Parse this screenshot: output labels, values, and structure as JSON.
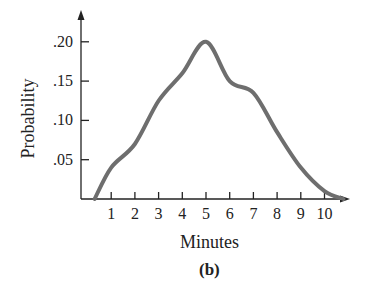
{
  "chart_data": {
    "type": "line",
    "title": "",
    "caption": "(b)",
    "xlabel": "Minutes",
    "ylabel": "Probability",
    "x_ticks": [
      "1",
      "2",
      "3",
      "4",
      "5",
      "6",
      "7",
      "8",
      "9",
      "10"
    ],
    "y_ticks": [
      ".05",
      ".10",
      ".15",
      ".20"
    ],
    "xlim": [
      0,
      11.5
    ],
    "ylim": [
      0,
      0.23
    ],
    "grid": false,
    "legend": null,
    "series": [
      {
        "name": "probability",
        "color": "#6e6e6e",
        "x": [
          0.3,
          1,
          2,
          3,
          4,
          5,
          6,
          7,
          8,
          9,
          10,
          10.8
        ],
        "y": [
          0.0,
          0.04,
          0.07,
          0.125,
          0.16,
          0.2,
          0.15,
          0.135,
          0.085,
          0.04,
          0.01,
          0.0
        ]
      }
    ]
  }
}
